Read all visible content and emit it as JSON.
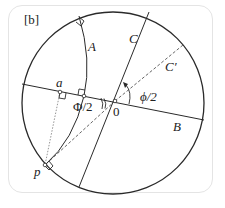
{
  "panel_label": "[b]",
  "labels": {
    "A": "A",
    "B": "B",
    "C": "C",
    "C_prime": "C′",
    "a": "a",
    "p": "p",
    "origin": "0",
    "phi_half": "ϕ/2",
    "Phi_half": "Φ/2"
  },
  "colors": {
    "stroke": "#2a2a2a",
    "dashed": "#555555",
    "dotted": "#888888",
    "frame": "#e4e4e4"
  }
}
